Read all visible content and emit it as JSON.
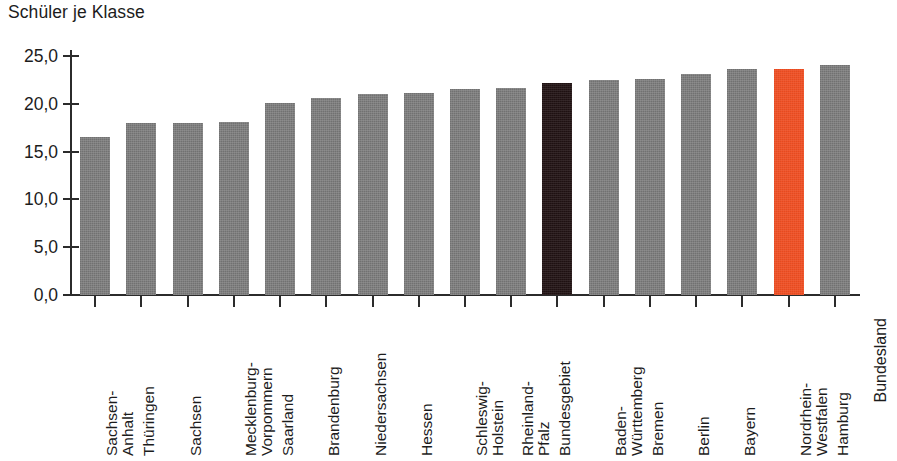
{
  "chart_data": {
    "type": "bar",
    "title": "Schüler je Klasse",
    "xlabel": "Bundesland",
    "ylabel": "Schüler je Klasse",
    "ylim": [
      0.0,
      25.0
    ],
    "grid": false,
    "legend": null,
    "ytick_labels": [
      "0,0",
      "5,0",
      "10,0",
      "15,0",
      "20,0",
      "25,0"
    ],
    "ytick_values": [
      0.0,
      5.0,
      10.0,
      15.0,
      20.0,
      25.0
    ],
    "categories": [
      "Sachsen-Anhalt",
      "Thüringen",
      "Sachsen",
      "Mecklenburg-Vorpommern",
      "Saarland",
      "Brandenburg",
      "Niedersachsen",
      "Hessen",
      "Schleswig-Holstein",
      "Rheinland-Pfalz",
      "Bundesgebiet",
      "Baden-Württemberg",
      "Bremen",
      "Berlin",
      "Bayern",
      "Nordrhein-Westfalen",
      "Hamburg"
    ],
    "category_lines": [
      [
        "Sachsen-",
        "Anhalt"
      ],
      [
        "Thüringen",
        ""
      ],
      [
        "Sachsen",
        ""
      ],
      [
        "Mecklenburg-",
        "Vorpommern"
      ],
      [
        "Saarland",
        ""
      ],
      [
        "Brandenburg",
        ""
      ],
      [
        "Niedersachsen",
        ""
      ],
      [
        "Hessen",
        ""
      ],
      [
        "Schleswig-",
        "Holstein"
      ],
      [
        "Rheinland-",
        "Pfalz"
      ],
      [
        "Bundesgebiet",
        ""
      ],
      [
        "Baden-",
        "Württemberg"
      ],
      [
        "Bremen",
        ""
      ],
      [
        "Berlin",
        ""
      ],
      [
        "Bayern",
        ""
      ],
      [
        "Nordrhein-",
        "Westfalen"
      ],
      [
        "Hamburg",
        ""
      ]
    ],
    "values": [
      16.5,
      18.0,
      18.0,
      18.1,
      20.1,
      20.6,
      21.0,
      21.1,
      21.6,
      21.7,
      22.2,
      22.5,
      22.6,
      23.1,
      23.6,
      23.6,
      24.1
    ],
    "bar_colors": [
      "#7b7b7b",
      "#7b7b7b",
      "#7b7b7b",
      "#7b7b7b",
      "#7b7b7b",
      "#7b7b7b",
      "#7b7b7b",
      "#7b7b7b",
      "#7b7b7b",
      "#7b7b7b",
      "#201213",
      "#7b7b7b",
      "#7b7b7b",
      "#7b7b7b",
      "#7b7b7b",
      "#f04f23",
      "#7b7b7b"
    ],
    "colors": {
      "bar_default": "#7b7b7b",
      "bar_national": "#201213",
      "bar_accent": "#f04f23",
      "axis": "#2b2b2b",
      "text": "#1c1c1c",
      "background": "#ffffff"
    }
  }
}
